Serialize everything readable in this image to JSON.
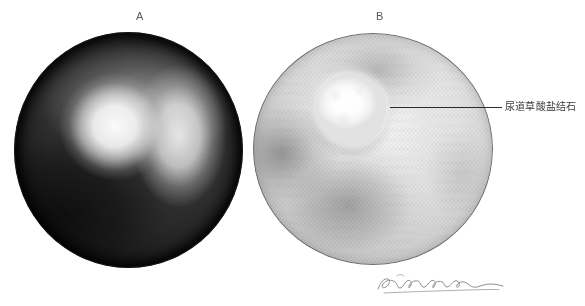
{
  "figure": {
    "panels": [
      {
        "label": "A",
        "name": "panel-a",
        "description": "dark endoscopic view"
      },
      {
        "label": "B",
        "name": "panel-b",
        "description": "endoscopic view with urethral oxalate calculus"
      }
    ],
    "annotations": [
      {
        "text": "尿道草酸盐结石",
        "target_panel": "B"
      }
    ],
    "signature": {
      "present": true,
      "style": "handwritten-cursive"
    },
    "colors": {
      "background": "#ffffff",
      "label_text": "#58585a",
      "annotation_text": "#3a3a3c",
      "leader_line": "#2b2b2d",
      "panel_a_field": "#101010",
      "panel_b_field": "#dcdcdc",
      "stone_highlight": "#ffffff"
    }
  }
}
